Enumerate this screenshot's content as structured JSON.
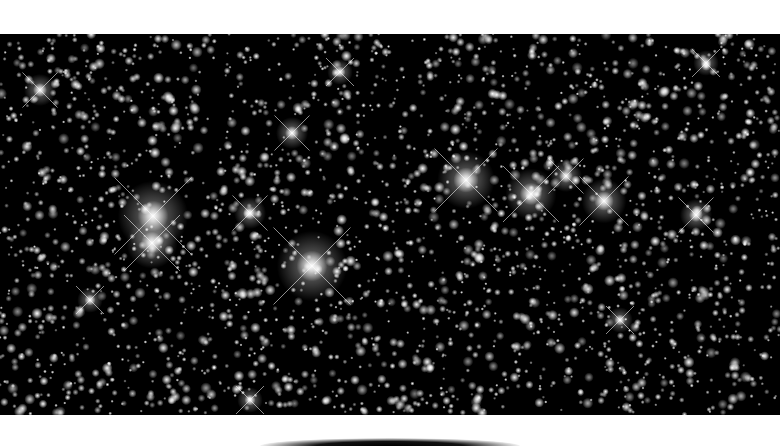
{
  "image": {
    "subject": "dense starfield",
    "palette": {
      "background": "#ffffff",
      "sky": "#000000",
      "star": "#ffffff"
    },
    "field": {
      "x": 0,
      "y": 34,
      "width": 780,
      "height": 381
    },
    "bright_stars": [
      {
        "x": 153,
        "y": 216,
        "r": 11
      },
      {
        "x": 152,
        "y": 243,
        "r": 8
      },
      {
        "x": 312,
        "y": 266,
        "r": 11
      },
      {
        "x": 466,
        "y": 180,
        "r": 9
      },
      {
        "x": 531,
        "y": 194,
        "r": 8
      },
      {
        "x": 604,
        "y": 201,
        "r": 7
      },
      {
        "x": 566,
        "y": 176,
        "r": 5
      },
      {
        "x": 250,
        "y": 213,
        "r": 5
      },
      {
        "x": 292,
        "y": 133,
        "r": 5
      },
      {
        "x": 696,
        "y": 215,
        "r": 5
      },
      {
        "x": 40,
        "y": 90,
        "r": 5
      },
      {
        "x": 340,
        "y": 72,
        "r": 4
      },
      {
        "x": 706,
        "y": 63,
        "r": 4
      },
      {
        "x": 90,
        "y": 300,
        "r": 4
      },
      {
        "x": 620,
        "y": 320,
        "r": 4
      },
      {
        "x": 250,
        "y": 400,
        "r": 4
      }
    ],
    "faint_star_count": 2600,
    "seed": 7
  }
}
